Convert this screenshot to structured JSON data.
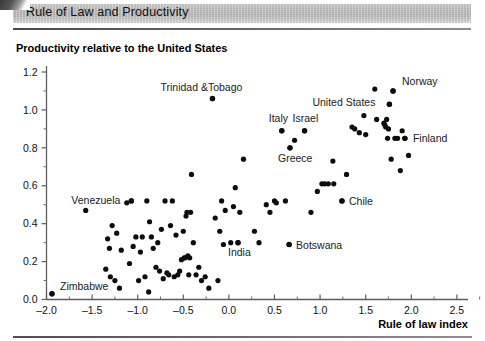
{
  "header": {
    "title": "Rule of Law and Productivity"
  },
  "axes": {
    "y_title": "Productivity relative to the United States",
    "x_title": "Rule of law index",
    "x_ticks": [
      "-2.0",
      "-1.5",
      "-1.0",
      "-0.5",
      "0.0",
      "0.5",
      "1.0",
      "1.5",
      "2.0",
      "2.5"
    ],
    "x_tick_values": [
      -2.0,
      -1.5,
      -1.0,
      -0.5,
      0.0,
      0.5,
      1.0,
      1.5,
      2.0,
      2.5
    ],
    "y_ticks": [
      "0.0",
      "0.2",
      "0.4",
      "0.6",
      "0.8",
      "1.0",
      "1.2"
    ],
    "y_tick_values": [
      0.0,
      0.2,
      0.4,
      0.6,
      0.8,
      1.0,
      1.2
    ]
  },
  "chart_data": {
    "type": "scatter",
    "title": "Rule of Law and Productivity",
    "xlabel": "Rule of law index",
    "ylabel": "Productivity relative to the United States",
    "xlim": [
      -2.0,
      2.6
    ],
    "ylim": [
      0.0,
      1.2
    ],
    "grid": false,
    "legend": "none",
    "marker_color": "#0d0d0d",
    "labeled_points": [
      {
        "name": "Zimbabwe",
        "x": -1.94,
        "y": 0.03,
        "label_dx": 8,
        "label_dy": -4
      },
      {
        "name": "Venezuela",
        "x": -1.07,
        "y": 0.52,
        "label_dx": -60,
        "label_dy": 3
      },
      {
        "name": "Trinidad &Tobago",
        "x": -0.18,
        "y": 1.06,
        "label_dx": -52,
        "label_dy": -8
      },
      {
        "name": "India",
        "x": 0.1,
        "y": 0.3,
        "label_dx": -10,
        "label_dy": 13
      },
      {
        "name": "Botswana",
        "x": 0.66,
        "y": 0.29,
        "label_dx": 7,
        "label_dy": 4
      },
      {
        "name": "Italy",
        "x": 0.58,
        "y": 0.89,
        "label_dx": -13,
        "label_dy": -9
      },
      {
        "name": "Greece",
        "x": 0.67,
        "y": 0.8,
        "label_dx": -12,
        "label_dy": 14
      },
      {
        "name": "Israel",
        "x": 0.83,
        "y": 0.89,
        "label_dx": -12,
        "label_dy": -9
      },
      {
        "name": "Chile",
        "x": 1.24,
        "y": 0.52,
        "label_dx": 7,
        "label_dy": 4
      },
      {
        "name": "United States",
        "x": 1.76,
        "y": 1.03,
        "label_dx": -77,
        "label_dy": 2
      },
      {
        "name": "Norway",
        "x": 1.8,
        "y": 1.1,
        "label_dx": 9,
        "label_dy": -6
      },
      {
        "name": "Finland",
        "x": 1.93,
        "y": 0.85,
        "label_dx": 8,
        "label_dy": 4
      }
    ],
    "points": [
      [
        -1.94,
        0.03
      ],
      [
        -1.57,
        0.47
      ],
      [
        -1.35,
        0.16
      ],
      [
        -1.33,
        0.32
      ],
      [
        -1.31,
        0.27
      ],
      [
        -1.3,
        0.12
      ],
      [
        -1.28,
        0.39
      ],
      [
        -1.25,
        0.1
      ],
      [
        -1.23,
        0.35
      ],
      [
        -1.2,
        0.06
      ],
      [
        -1.18,
        0.26
      ],
      [
        -1.12,
        0.51
      ],
      [
        -1.09,
        0.19
      ],
      [
        -1.07,
        0.52
      ],
      [
        -1.05,
        0.28
      ],
      [
        -1.02,
        0.33
      ],
      [
        -0.99,
        0.1
      ],
      [
        -0.97,
        0.25
      ],
      [
        -0.95,
        0.33
      ],
      [
        -0.92,
        0.12
      ],
      [
        -0.9,
        0.52
      ],
      [
        -0.88,
        0.04
      ],
      [
        -0.87,
        0.41
      ],
      [
        -0.85,
        0.33
      ],
      [
        -0.83,
        0.27
      ],
      [
        -0.8,
        0.17
      ],
      [
        -0.78,
        0.3
      ],
      [
        -0.76,
        0.15
      ],
      [
        -0.74,
        0.37
      ],
      [
        -0.72,
        0.11
      ],
      [
        -0.7,
        0.52
      ],
      [
        -0.68,
        0.14
      ],
      [
        -0.66,
        0.13
      ],
      [
        -0.64,
        0.39
      ],
      [
        -0.62,
        0.52
      ],
      [
        -0.6,
        0.12
      ],
      [
        -0.58,
        0.34
      ],
      [
        -0.56,
        0.13
      ],
      [
        -0.54,
        0.15
      ],
      [
        -0.52,
        0.21
      ],
      [
        -0.5,
        0.36
      ],
      [
        -0.49,
        0.22
      ],
      [
        -0.48,
        0.22
      ],
      [
        -0.47,
        0.44
      ],
      [
        -0.46,
        0.46
      ],
      [
        -0.45,
        0.23
      ],
      [
        -0.44,
        0.13
      ],
      [
        -0.43,
        0.22
      ],
      [
        -0.42,
        0.46
      ],
      [
        -0.41,
        0.66
      ],
      [
        -0.39,
        0.3
      ],
      [
        -0.36,
        0.13
      ],
      [
        -0.33,
        0.17
      ],
      [
        -0.3,
        0.1
      ],
      [
        -0.26,
        0.12
      ],
      [
        -0.22,
        0.06
      ],
      [
        -0.18,
        1.06
      ],
      [
        -0.15,
        0.43
      ],
      [
        -0.12,
        0.1
      ],
      [
        -0.1,
        0.36
      ],
      [
        -0.08,
        0.52
      ],
      [
        -0.06,
        0.29
      ],
      [
        -0.04,
        0.47
      ],
      [
        0.02,
        0.3
      ],
      [
        0.05,
        0.49
      ],
      [
        0.07,
        0.59
      ],
      [
        0.1,
        0.3
      ],
      [
        0.12,
        0.46
      ],
      [
        0.16,
        0.74
      ],
      [
        0.28,
        0.36
      ],
      [
        0.33,
        0.3
      ],
      [
        0.41,
        0.5
      ],
      [
        0.45,
        0.46
      ],
      [
        0.5,
        0.52
      ],
      [
        0.52,
        0.51
      ],
      [
        0.58,
        0.89
      ],
      [
        0.62,
        0.52
      ],
      [
        0.66,
        0.29
      ],
      [
        0.67,
        0.8
      ],
      [
        0.72,
        0.84
      ],
      [
        0.83,
        0.89
      ],
      [
        0.9,
        0.46
      ],
      [
        0.97,
        0.57
      ],
      [
        1.02,
        0.61
      ],
      [
        1.05,
        0.61
      ],
      [
        1.09,
        0.61
      ],
      [
        1.14,
        0.73
      ],
      [
        1.15,
        0.61
      ],
      [
        1.24,
        0.52
      ],
      [
        1.29,
        0.66
      ],
      [
        1.35,
        0.91
      ],
      [
        1.38,
        0.9
      ],
      [
        1.43,
        0.88
      ],
      [
        1.48,
        0.97
      ],
      [
        1.5,
        0.87
      ],
      [
        1.6,
        1.11
      ],
      [
        1.62,
        0.95
      ],
      [
        1.7,
        0.93
      ],
      [
        1.71,
        0.92
      ],
      [
        1.72,
        0.91
      ],
      [
        1.73,
        0.95
      ],
      [
        1.74,
        0.85
      ],
      [
        1.75,
        0.9
      ],
      [
        1.76,
        1.03
      ],
      [
        1.78,
        0.74
      ],
      [
        1.8,
        1.1
      ],
      [
        1.82,
        0.85
      ],
      [
        1.85,
        0.85
      ],
      [
        1.88,
        0.68
      ],
      [
        1.9,
        0.89
      ],
      [
        1.93,
        0.85
      ],
      [
        1.97,
        0.76
      ]
    ]
  }
}
